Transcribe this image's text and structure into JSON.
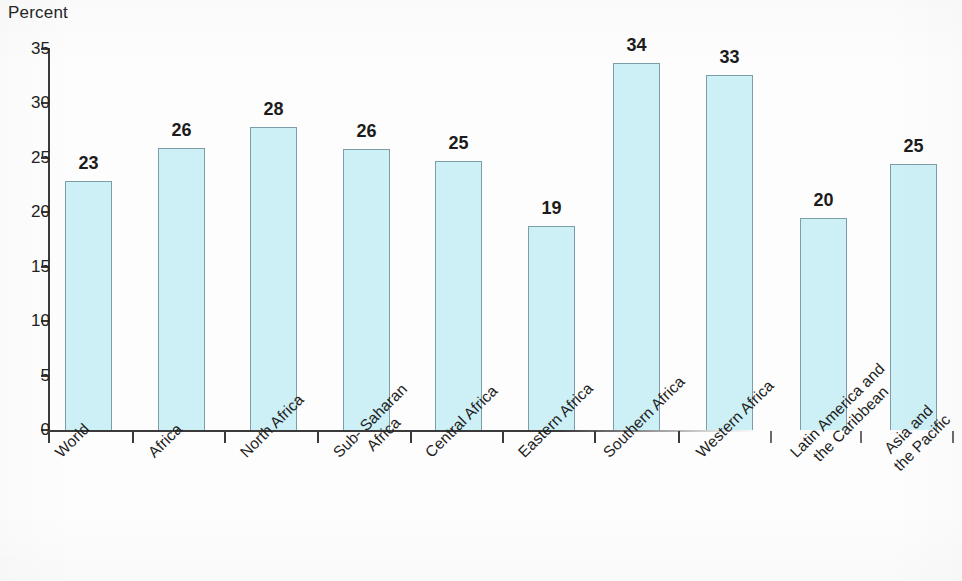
{
  "chart_data": {
    "type": "bar",
    "title": "",
    "subtitle": "",
    "xlabel": "",
    "ylabel": "Percent",
    "ylim": [
      0,
      35
    ],
    "ytick_step": 5,
    "ytick_labels": [
      "35",
      "30",
      "25",
      "20",
      "15",
      "10",
      "5",
      "0"
    ],
    "grid": false,
    "legend": null,
    "categories": [
      "World",
      "Africa",
      "North Africa",
      "Sub- Saharan Africa",
      "Central Africa",
      "Eastern Africa",
      "Southern Africa",
      "Western Africa",
      "Latin America and the Caribbean",
      "Asia and the Pacific"
    ],
    "category_lines": [
      [
        "World"
      ],
      [
        "Africa"
      ],
      [
        "North Africa"
      ],
      [
        "Sub- Saharan",
        "Africa"
      ],
      [
        "Central Africa"
      ],
      [
        "Eastern Africa"
      ],
      [
        "Southern Africa"
      ],
      [
        "Western Africa"
      ],
      [
        "Latin America and",
        "the Caribbean"
      ],
      [
        "Asia and",
        "the Pacific"
      ]
    ],
    "values": [
      23,
      26,
      28,
      26,
      25,
      19,
      34,
      33,
      20,
      25
    ],
    "value_labels": [
      "23",
      "26",
      "28",
      "26",
      "25",
      "19",
      "34",
      "33",
      "20",
      "25"
    ],
    "bar_precise_values": [
      22.9,
      25.9,
      27.8,
      25.8,
      24.7,
      18.7,
      33.7,
      32.6,
      19.5,
      24.4
    ],
    "colors": {
      "bar_fill": "#cdf0f6",
      "bar_border": "#7d9ea9",
      "axis": "#3a3a3a",
      "text": "#1c1c1c",
      "background": "#fdfdfd"
    }
  }
}
